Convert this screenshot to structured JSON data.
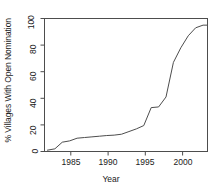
{
  "chart_data": {
    "type": "line",
    "title": "",
    "subtitle": "",
    "xlabel": "Year",
    "ylabel": "% Villages With Open Nomination",
    "xlim": [
      1981.6,
      2003.6
    ],
    "ylim": [
      0,
      100
    ],
    "xticks": [
      1985,
      1990,
      1995,
      2000
    ],
    "xtick_labels": [
      "1985",
      "1990",
      "1995",
      "2000"
    ],
    "yticks": [
      0,
      20,
      40,
      60,
      80,
      100
    ],
    "ytick_labels": [
      "0",
      "20",
      "40",
      "60",
      "80",
      "100"
    ],
    "grid": false,
    "legend": null,
    "legend_position": "none",
    "line_color": "#4d4d4d",
    "frame_color": "#4d4d4d",
    "background": "#ffffff",
    "series": [
      {
        "name": "% Villages With Open Nomination",
        "x": [
          1982,
          1983,
          1984,
          1985,
          1986,
          1987,
          1988,
          1989,
          1990,
          1991,
          1992,
          1993,
          1994,
          1995,
          1996,
          1997,
          1998,
          1999,
          2000,
          2001,
          2002,
          2003,
          2003.5
        ],
        "values": [
          1,
          2,
          7,
          8,
          10,
          10.5,
          11,
          11.5,
          12,
          12.3,
          13,
          15,
          17,
          19.5,
          33,
          33.5,
          41,
          67,
          78,
          87,
          93,
          95,
          95
        ]
      }
    ]
  },
  "axis": {
    "x_title": "Year",
    "y_title": "% Villages With Open Nomination"
  }
}
